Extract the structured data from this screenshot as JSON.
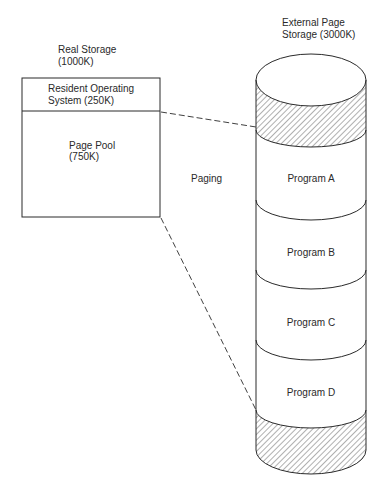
{
  "real_storage": {
    "title_line1": "Real Storage",
    "title_line2": "(1000K)",
    "resident_os_line1": "Resident Operating",
    "resident_os_line2": "System (250K)",
    "page_pool_line1": "Page Pool",
    "page_pool_line2": "(750K)"
  },
  "external_storage": {
    "title_line1": "External Page",
    "title_line2": "Storage (3000K)",
    "programs": [
      "Program A",
      "Program B",
      "Program C",
      "Program D"
    ]
  },
  "paging_label": "Paging"
}
